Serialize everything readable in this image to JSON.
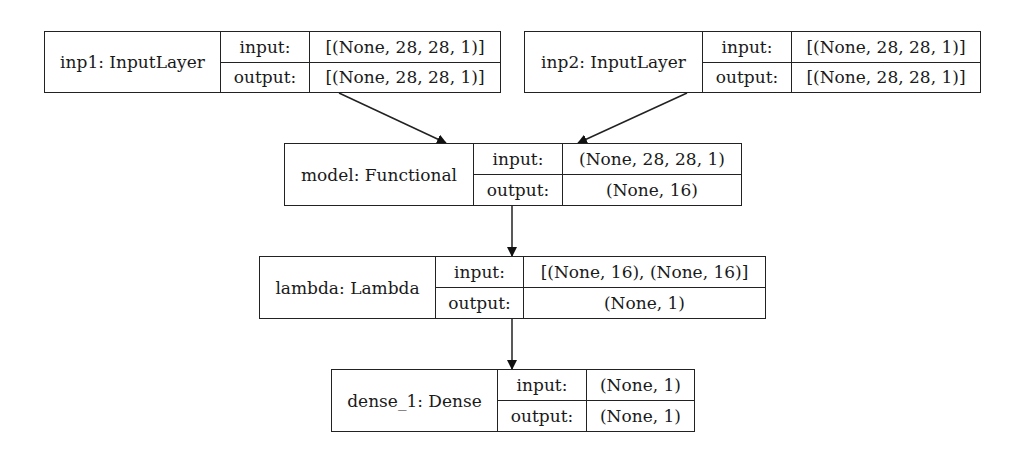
{
  "diagram": {
    "type": "keras-model-plot",
    "nodes": [
      {
        "id": "inp1",
        "name": "inp1: InputLayer",
        "input_label": "input:",
        "output_label": "output:",
        "input": "[(None, 28, 28, 1)]",
        "output": "[(None, 28, 28, 1)]",
        "box": {
          "x": 44,
          "y": 31,
          "w": 457,
          "h": 62,
          "d1": 176,
          "d2": 265
        }
      },
      {
        "id": "inp2",
        "name": "inp2: InputLayer",
        "input_label": "input:",
        "output_label": "output:",
        "input": "[(None, 28, 28, 1)]",
        "output": "[(None, 28, 28, 1)]",
        "box": {
          "x": 524,
          "y": 31,
          "w": 457,
          "h": 62,
          "d1": 178,
          "d2": 267
        }
      },
      {
        "id": "model",
        "name": "model: Functional",
        "input_label": "input:",
        "output_label": "output:",
        "input": "(None, 28, 28, 1)",
        "output": "(None, 16)",
        "box": {
          "x": 284,
          "y": 143,
          "w": 458,
          "h": 63,
          "d1": 189,
          "d2": 278
        }
      },
      {
        "id": "lambda",
        "name": "lambda: Lambda",
        "input_label": "input:",
        "output_label": "output:",
        "input": "[(None, 16), (None, 16)]",
        "output": "(None, 1)",
        "box": {
          "x": 259,
          "y": 256,
          "w": 507,
          "h": 63,
          "d1": 176,
          "d2": 264
        }
      },
      {
        "id": "dense_1",
        "name": "dense_1: Dense",
        "input_label": "input:",
        "output_label": "output:",
        "input": "(None, 1)",
        "output": "(None, 1)",
        "box": {
          "x": 331,
          "y": 369,
          "w": 364,
          "h": 63,
          "d1": 166,
          "d2": 255
        }
      }
    ],
    "edges": [
      {
        "from": "inp1",
        "to": "model",
        "x1": 339,
        "y1": 93,
        "x2": 446,
        "y2": 143
      },
      {
        "from": "inp2",
        "to": "model",
        "x1": 687,
        "y1": 93,
        "x2": 578,
        "y2": 143
      },
      {
        "from": "model",
        "to": "lambda",
        "x1": 512,
        "y1": 206,
        "x2": 512,
        "y2": 256
      },
      {
        "from": "lambda",
        "to": "dense_1",
        "x1": 512,
        "y1": 319,
        "x2": 512,
        "y2": 369
      }
    ]
  }
}
